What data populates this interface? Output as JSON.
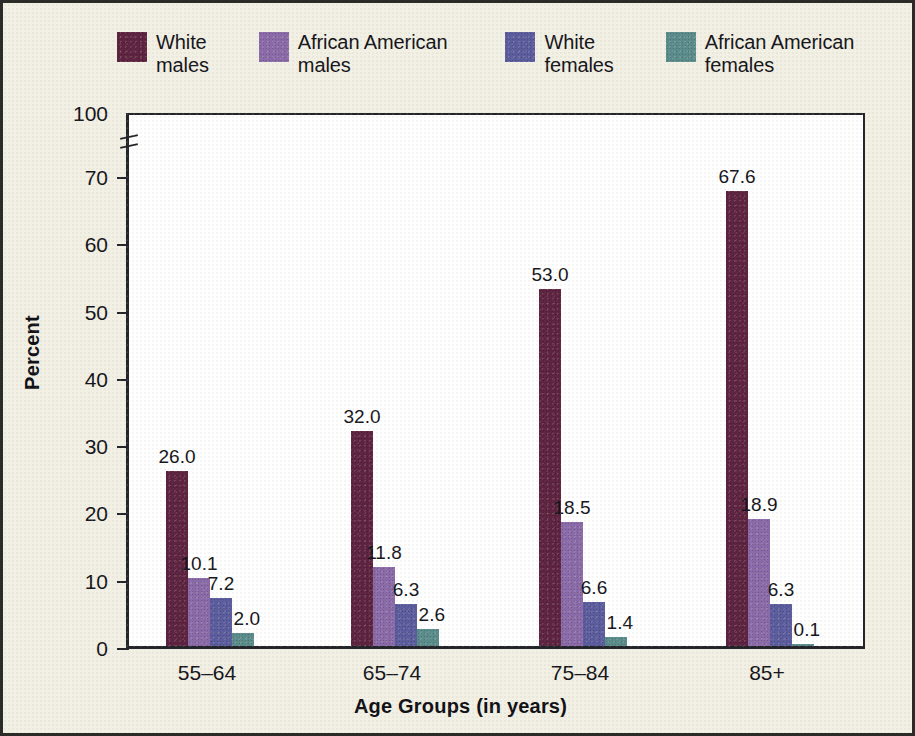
{
  "chart_data": {
    "type": "bar",
    "title": "",
    "xlabel": "Age Groups (in years)",
    "ylabel": "Percent",
    "categories": [
      "55–64",
      "65–74",
      "75–84",
      "85+"
    ],
    "ylim": [
      0,
      100
    ],
    "yticks": [
      "0",
      "10",
      "20",
      "30",
      "40",
      "50",
      "60",
      "70",
      "100"
    ],
    "ytick_values": [
      0,
      10,
      20,
      30,
      40,
      50,
      60,
      70,
      100
    ],
    "axis_break": true,
    "axis_break_between": [
      70,
      100
    ],
    "grid": false,
    "legend_position": "top",
    "series": [
      {
        "name": "White\nmales",
        "color": "#5e2340",
        "values": [
          26.0,
          32.0,
          53.0,
          67.6
        ],
        "labels": [
          "26.0",
          "32.0",
          "53.0",
          "67.6"
        ]
      },
      {
        "name": "African American\nmales",
        "color": "#8a6aa8",
        "values": [
          10.1,
          11.8,
          18.5,
          18.9
        ],
        "labels": [
          "10.1",
          "11.8",
          "18.5",
          "18.9"
        ]
      },
      {
        "name": "White\nfemales",
        "color": "#5b5c9e",
        "values": [
          7.2,
          6.3,
          6.6,
          6.3
        ],
        "labels": [
          "7.2",
          "6.3",
          "6.6",
          "6.3"
        ]
      },
      {
        "name": "African American\nfemales",
        "color": "#5a8c8c",
        "values": [
          2.0,
          2.6,
          1.4,
          0.1
        ],
        "labels": [
          "2.0",
          "2.6",
          "1.4",
          "0.1"
        ]
      }
    ]
  },
  "legend": {
    "items": [
      {
        "label": "White\nmales",
        "color": "#5e2340"
      },
      {
        "label": "African American\nmales",
        "color": "#8a6aa8"
      },
      {
        "label": "White\nfemales",
        "color": "#5b5c9e"
      },
      {
        "label": "African American\nfemales",
        "color": "#5a8c8c"
      }
    ]
  },
  "axes": {
    "y_title": "Percent",
    "x_title": "Age Groups (in years)"
  },
  "colors": {
    "background": "#f2f0e4",
    "plot_background": "#ffffff",
    "axis": "#23232a",
    "text": "#14141a"
  }
}
